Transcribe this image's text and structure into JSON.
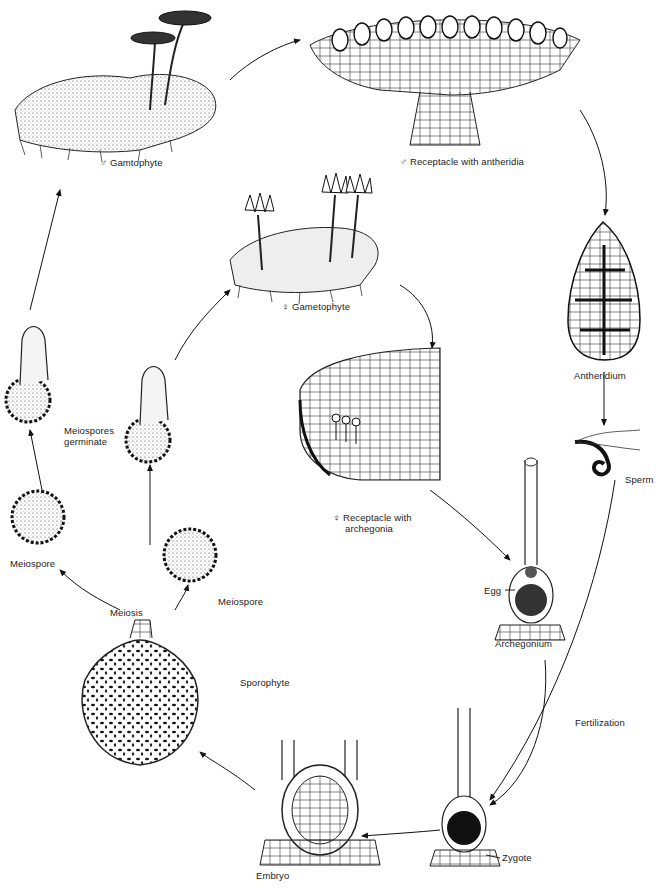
{
  "diagram": {
    "stages": [
      {
        "id": "male_gametophyte",
        "label": "♂ Gamtophyte"
      },
      {
        "id": "male_receptacle",
        "label": "♂ Receptacle with antheridia"
      },
      {
        "id": "antheridium",
        "label": "Antheridium"
      },
      {
        "id": "sperm",
        "label": "Sperm"
      },
      {
        "id": "female_gametophyte",
        "label": "♀ Gametophyte"
      },
      {
        "id": "female_receptacle",
        "label_line1": "♀ Receptacle with",
        "label_line2": "archegonia"
      },
      {
        "id": "archegonium",
        "label": "Archegonium"
      },
      {
        "id": "egg",
        "label": "Egg"
      },
      {
        "id": "fertilization",
        "label": "Fertilization"
      },
      {
        "id": "zygote",
        "label": "Zygote"
      },
      {
        "id": "embryo",
        "label": "Embryo"
      },
      {
        "id": "sporophyte",
        "label": "Sporophyte"
      },
      {
        "id": "meiosis",
        "label": "Meiosis"
      },
      {
        "id": "meiospore_left",
        "label": "Meiospore"
      },
      {
        "id": "meiospore_right",
        "label": "Meiospore"
      },
      {
        "id": "meiospores_germinate",
        "label_line1": "Meiospores",
        "label_line2": "germinate"
      }
    ]
  }
}
